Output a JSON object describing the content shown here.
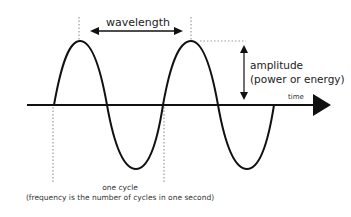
{
  "diagram": {
    "labels": {
      "wavelength": "wavelength",
      "amplitude": "amplitude",
      "amplitude_sub": "(power or energy)",
      "time_axis": "time",
      "cycle": "one cycle",
      "cycle_sub": "(frequency is the number of cycles in one second)"
    },
    "colors": {
      "wave": "#111111",
      "axis": "#111111",
      "dotted": "#999999",
      "text": "#222222",
      "background": "#ffffff"
    },
    "wave": {
      "type": "sine",
      "cycles": 2,
      "start_x": 54,
      "wavelength_px": 110,
      "axis_y": 105,
      "amplitude_px": 64
    }
  }
}
